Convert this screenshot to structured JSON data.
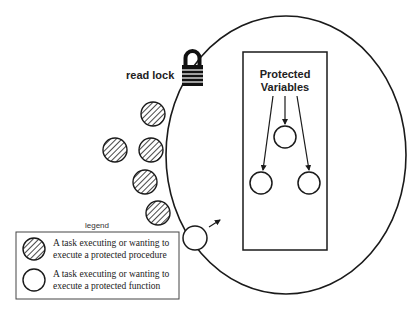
{
  "diagram": {
    "lock_label": "read lock",
    "protected_box": {
      "title_line1": "Protected",
      "title_line2": "Variables"
    },
    "legend": {
      "title": "legend",
      "items": [
        {
          "symbol": "hatched-circle",
          "line1": "A task executing or wanting to",
          "line2": "execute a protected procedure"
        },
        {
          "symbol": "open-circle",
          "line1": "A task executing or wanting to",
          "line2": "execute a protected function"
        }
      ]
    },
    "colors": {
      "stroke": "#1a1a1a",
      "background": "#ffffff"
    }
  }
}
